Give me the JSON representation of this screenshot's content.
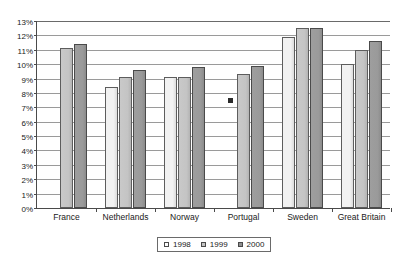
{
  "chart_data": {
    "type": "bar",
    "title": "",
    "subtitle": "",
    "xlabel": "",
    "ylabel": "",
    "ylim": [
      0,
      13
    ],
    "ytick_step": 1,
    "ytick_labels": [
      "0%",
      "1%",
      "2%",
      "3%",
      "4%",
      "5%",
      "6%",
      "7%",
      "8%",
      "9%",
      "10%",
      "11%",
      "12%",
      "13%"
    ],
    "grid": true,
    "grid_orientation": "horizontal",
    "legend_position": "bottom-center",
    "categories": [
      "France",
      "Netherlands",
      "Norway",
      "Portugal",
      "Sweden",
      "Great Britain"
    ],
    "series": [
      {
        "name": "1998",
        "color": "#f2f2f2",
        "values": [
          null,
          8.4,
          9.1,
          null,
          11.9,
          10.0
        ]
      },
      {
        "name": "1999",
        "color": "#c4c4c4",
        "values": [
          11.1,
          9.1,
          9.1,
          9.3,
          12.5,
          11.0
        ]
      },
      {
        "name": "2000",
        "color": "#9a9a9a",
        "values": [
          11.4,
          9.6,
          9.8,
          9.9,
          12.5,
          11.6
        ]
      }
    ],
    "annotations": [
      {
        "name": "stray-marker",
        "category": "Portugal",
        "series": "1998",
        "value": 7.6
      }
    ]
  },
  "legend": {
    "entries": [
      {
        "label": "1998",
        "swatch": "legend-swatch-1998"
      },
      {
        "label": "1999",
        "swatch": "legend-swatch-1999"
      },
      {
        "label": "2000",
        "swatch": "legend-swatch-2000"
      }
    ]
  }
}
